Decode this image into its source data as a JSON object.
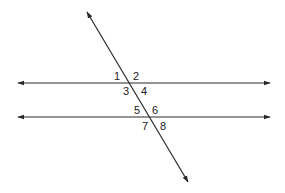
{
  "diagram": {
    "stroke_color": "#2a2a2a",
    "background": "#ffffff",
    "parallel_lines": [
      {
        "name": "upper-line",
        "x1": 18,
        "y1": 83,
        "x2": 270,
        "y2": 83
      },
      {
        "name": "lower-line",
        "x1": 18,
        "y1": 117,
        "x2": 270,
        "y2": 117
      }
    ],
    "transversal": {
      "x1": 87,
      "y1": 12,
      "x2": 188,
      "y2": 182
    },
    "angle_labels": [
      {
        "text": "1",
        "x": 114,
        "y": 80
      },
      {
        "text": "2",
        "x": 133,
        "y": 80
      },
      {
        "text": "3",
        "x": 123,
        "y": 95
      },
      {
        "text": "4",
        "x": 141,
        "y": 95
      },
      {
        "text": "5",
        "x": 134,
        "y": 114
      },
      {
        "text": "6",
        "x": 152,
        "y": 114
      },
      {
        "text": "7",
        "x": 142,
        "y": 130
      },
      {
        "text": "8",
        "x": 160,
        "y": 130
      }
    ]
  }
}
